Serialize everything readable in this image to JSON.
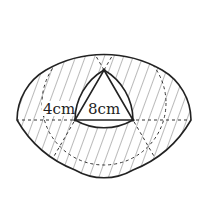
{
  "diagram": {
    "labels": {
      "outer_gap": "4cm",
      "side": "8cm"
    },
    "colors": {
      "stroke": "#222222",
      "hatch": "#555555",
      "dash": "#333333"
    }
  }
}
